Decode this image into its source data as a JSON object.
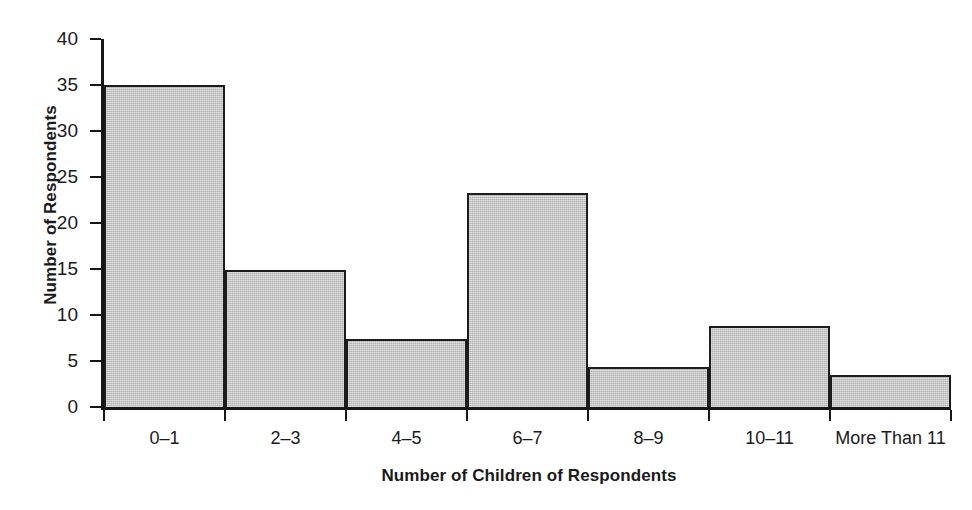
{
  "chart_data": {
    "type": "bar",
    "title": "",
    "subtitle": "",
    "xlabel": "Number of Children of Respondents",
    "ylabel": "Number of Respondents",
    "categories": [
      "0–1",
      "2–3",
      "4–5",
      "6–7",
      "8–9",
      "10–11",
      "More Than 11"
    ],
    "values": [
      35,
      14.9,
      7.4,
      23.3,
      4.3,
      8.8,
      3.5
    ],
    "ylim": [
      0,
      40
    ],
    "y_ticks": [
      0,
      5,
      10,
      15,
      20,
      25,
      30,
      35,
      40
    ],
    "y_tick_labels": [
      "0",
      "5",
      "10",
      "15",
      "20",
      "25",
      "30",
      "35",
      "40"
    ],
    "grid": false,
    "legend": null,
    "bar_fill_color": "#c4c4c4",
    "bar_edge_color": "#1c1c1c",
    "axis_color": "#161616",
    "background_color": "#ffffff",
    "annotations": []
  },
  "axes": {
    "y_title": "Number of Respondents",
    "x_title": "Number of Children of Respondents"
  }
}
